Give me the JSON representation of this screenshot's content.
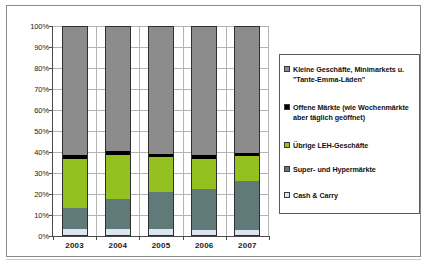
{
  "figure": {
    "caption": ""
  },
  "chart_data": {
    "type": "bar",
    "subtype": "stacked-100-percent",
    "title": "",
    "xlabel": "",
    "ylabel": "",
    "categories": [
      "2003",
      "2004",
      "2005",
      "2006",
      "2007"
    ],
    "ylim": [
      0,
      100
    ],
    "y_unit": "%",
    "grid": true,
    "legend_position": "right",
    "y_ticks": [
      "0%",
      "10%",
      "20%",
      "30%",
      "40%",
      "50%",
      "60%",
      "70%",
      "80%",
      "90%",
      "100%"
    ],
    "y_tick_values": [
      0,
      10,
      20,
      30,
      40,
      50,
      60,
      70,
      80,
      90,
      100
    ],
    "series": [
      {
        "name": "Cash & Carry",
        "color": "#DCE6F2",
        "legend_marker": "cash-and-carry-swatch",
        "values": [
          3.3,
          3.4,
          3.5,
          2.9,
          2.7
        ]
      },
      {
        "name": "Super- und Hypermärkte",
        "color": "#5F7A78",
        "legend_marker": "super-hyper-swatch",
        "values": [
          10.1,
          14.2,
          17.6,
          19.4,
          23.7
        ]
      },
      {
        "name": "Übrige LEH-Geschäfte",
        "color": "#94C11F",
        "legend_marker": "uebrige-leh-swatch",
        "values": [
          23.3,
          20.9,
          16.5,
          14.6,
          11.8
        ]
      },
      {
        "name": "Offene Märkte (wie Wochenmärkte aber täglich geöffnet)",
        "color": "#000000",
        "legend_marker": "offene-maerkte-swatch",
        "values": [
          1.9,
          1.8,
          1.7,
          1.6,
          1.4
        ]
      },
      {
        "name": "Kleine Geschäfte, Minimarkets u. \"Tante-Emma-Läden\"",
        "color": "#8C8C8C",
        "legend_marker": "kleine-geschaefte-swatch",
        "values": [
          61.4,
          59.7,
          60.7,
          61.5,
          60.4
        ]
      }
    ],
    "legend_entries": [
      "Kleine Geschäfte, Minimarkets u.\n\"Tante-Emma-Läden\"",
      "Offene Märkte (wie Wochenmärkte\naber täglich geöffnet)",
      "Übrige LEH-Geschäfte",
      "Super- und Hypermärkte",
      "Cash & Carry"
    ],
    "legend_colors": [
      "#8C8C8C",
      "#000000",
      "#94C11F",
      "#5F7A78",
      "#DCE6F2"
    ]
  }
}
